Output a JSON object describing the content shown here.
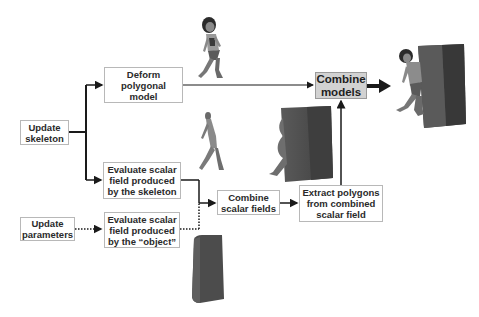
{
  "diagram": {
    "nodes": {
      "update_skeleton": "Update\nskeleton",
      "deform_model": "Deform\npolygonal\nmodel",
      "combine_models": "Combine\nmodels",
      "eval_skeleton_field": "Evaluate scalar\nfield produced\nby the skeleton",
      "update_parameters": "Update\nparameters",
      "eval_object_field": "Evaluate scalar\nfield produced\nby the “object”",
      "combine_scalar_fields": "Combine\nscalar fields",
      "extract_polygons": "Extract polygons\nfrom combined\nscalar field"
    },
    "edges": [
      {
        "from": "update_skeleton",
        "to": "deform_model",
        "style": "solid"
      },
      {
        "from": "update_skeleton",
        "to": "eval_skeleton_field",
        "style": "solid"
      },
      {
        "from": "deform_model",
        "to": "combine_models",
        "style": "solid"
      },
      {
        "from": "eval_skeleton_field",
        "to": "combine_scalar_fields",
        "style": "solid"
      },
      {
        "from": "update_parameters",
        "to": "eval_object_field",
        "style": "dotted"
      },
      {
        "from": "eval_object_field",
        "to": "combine_scalar_fields",
        "style": "dotted"
      },
      {
        "from": "combine_scalar_fields",
        "to": "extract_polygons",
        "style": "solid"
      },
      {
        "from": "extract_polygons",
        "to": "combine_models",
        "style": "solid"
      },
      {
        "from": "combine_models",
        "to": "result_image",
        "style": "thick"
      }
    ],
    "images": {
      "walking_figure": "character-polygonal-model",
      "skeleton_figure": "skeleton-implicit-figure",
      "deformed_block": "block-deformed-by-skeleton",
      "object_block": "rectangular-object-block",
      "result": "character-with-deformed-block"
    },
    "colors": {
      "line": "#1a1a1a",
      "box_border": "#b8b8b8",
      "highlight_box": "#d2d2d2"
    }
  }
}
